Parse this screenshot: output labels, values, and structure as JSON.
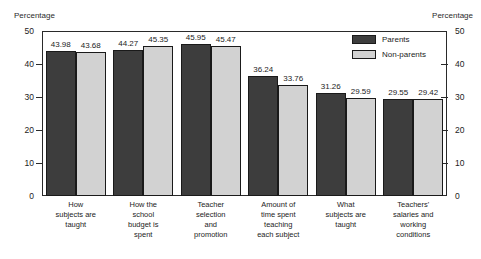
{
  "chart_data": {
    "type": "bar",
    "title": "",
    "xlabel": "",
    "ylabel": "Percentage",
    "ylabel_right": "Percentage",
    "ylim": [
      0,
      50
    ],
    "yticks": [
      0,
      10,
      20,
      30,
      40,
      50
    ],
    "ytick_labels": [
      "0",
      "10",
      "20",
      "30",
      "40",
      "50"
    ],
    "grid": false,
    "legend_position": "top-right",
    "categories": [
      "How subjects are taught",
      "How the school budget is spent",
      "Teacher selection and promotion",
      "Amount of time spent teaching each subject",
      "What subjects are taught",
      "Teachers' salaries and working conditions"
    ],
    "category_lines": [
      [
        "How",
        "subjects are",
        "taught"
      ],
      [
        "How the",
        "school",
        "budget is",
        "spent"
      ],
      [
        "Teacher",
        "selection",
        "and",
        "promotion"
      ],
      [
        "Amount of",
        "time spent",
        "teaching",
        "each subject"
      ],
      [
        "What",
        "subjects are",
        "taught"
      ],
      [
        "Teachers'",
        "salaries and",
        "working",
        "conditions"
      ]
    ],
    "series": [
      {
        "name": "Parents",
        "color": "#3d3d3d",
        "values": [
          43.98,
          44.27,
          45.95,
          36.24,
          31.26,
          29.55
        ],
        "labels": [
          "43.98",
          "44.27",
          "45.95",
          "36.24",
          "31.26",
          "29.55"
        ]
      },
      {
        "name": "Non-parents",
        "color": "#d2d2d2",
        "values": [
          43.68,
          45.35,
          45.47,
          33.76,
          29.59,
          29.42
        ],
        "labels": [
          "43.68",
          "45.35",
          "45.47",
          "33.76",
          "29.59",
          "29.42"
        ]
      }
    ]
  },
  "axes": {
    "left_title": "Percentage",
    "right_title": "Percentage"
  },
  "legend": {
    "items": [
      {
        "label": "Parents"
      },
      {
        "label": "Non-parents"
      }
    ]
  }
}
